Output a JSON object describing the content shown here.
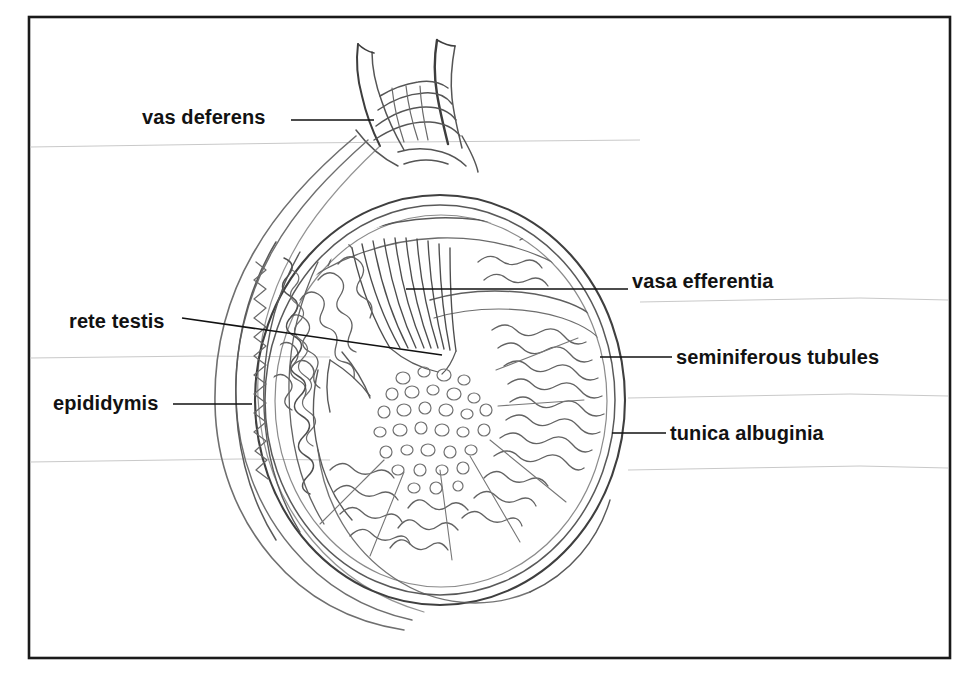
{
  "figure": {
    "type": "anatomical line drawing",
    "border_color": "#1a1a1a",
    "ink_color": "#4a4a4a",
    "leader_color": "#111111",
    "text_color": "#121212",
    "background_color": "#ffffff"
  },
  "labels": [
    {
      "id": "vas-deferens",
      "text": "vas deferens",
      "side": "left",
      "leader": "horizontal"
    },
    {
      "id": "vasa-efferentia",
      "text": "vasa efferentia",
      "side": "right",
      "leader": "horizontal"
    },
    {
      "id": "rete-testis",
      "text": "rete testis",
      "side": "left",
      "leader": "slanted"
    },
    {
      "id": "seminiferous-tubules",
      "text": "seminiferous tubules",
      "side": "right",
      "leader": "horizontal"
    },
    {
      "id": "epididymis",
      "text": "epididymis",
      "side": "left",
      "leader": "horizontal"
    },
    {
      "id": "tunica-albuginia",
      "text": "tunica albuginia",
      "side": "right",
      "leader": "horizontal"
    }
  ]
}
